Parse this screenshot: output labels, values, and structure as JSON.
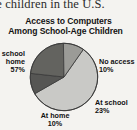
{
  "document": {
    "body_text_fragment": "ge children in the U.S."
  },
  "chart_data": {
    "type": "pie",
    "title": "Access to Computers Among School-Age Children",
    "title_line1": "Access to Computers",
    "title_line2": "Among School-Age Children",
    "xlabel": "",
    "ylabel": "",
    "legend_position": "callout-labels",
    "grid": false,
    "units": "percent",
    "categories": [
      "At school and home",
      "No access",
      "At school",
      "At home"
    ],
    "values": [
      57,
      10,
      23,
      10
    ],
    "slices": [
      {
        "label": "At school and home",
        "label_line1": "school",
        "label_line2": "home",
        "value": 57,
        "value_text": "57%",
        "color": "#c9c9c6",
        "clipped": true
      },
      {
        "label": "No access",
        "label_line1": "No access",
        "label_line2": "",
        "value": 10,
        "value_text": "10%",
        "color": "#565654",
        "clipped": false
      },
      {
        "label": "At school",
        "label_line1": "At school",
        "label_line2": "",
        "value": 23,
        "value_text": "23%",
        "color": "#63635f",
        "clipped": false
      },
      {
        "label": "At home",
        "label_line1": "At home",
        "label_line2": "",
        "value": 10,
        "value_text": "10%",
        "color": "#9b9b97",
        "clipped": false
      }
    ]
  }
}
